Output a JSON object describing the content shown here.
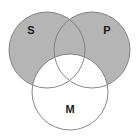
{
  "figure": {
    "name": "three-circle-venn-diagram",
    "background_color": "#ffffff",
    "width": 139,
    "height": 138
  },
  "style": {
    "shaded_fill": "#b5b5b5",
    "unshaded_fill": "#ffffff",
    "stroke_color": "#7a7a7a",
    "stroke_width": 0.9,
    "label_color": "#1a1a1a"
  },
  "circles": [
    {
      "id": "S",
      "label": "S",
      "position": "top-left",
      "shaded": true,
      "fill": "#b5b5b5",
      "cx": 47,
      "cy": 50,
      "r": 38,
      "label_x": 31,
      "label_y": 31
    },
    {
      "id": "P",
      "label": "P",
      "position": "top-right",
      "shaded": true,
      "fill": "#b5b5b5",
      "cx": 92,
      "cy": 50,
      "r": 38,
      "label_x": 107,
      "label_y": 31
    },
    {
      "id": "M",
      "label": "M",
      "position": "bottom-center",
      "shaded": false,
      "fill": "#ffffff",
      "cx": 70,
      "cy": 92,
      "r": 38,
      "label_x": 70,
      "label_y": 110
    }
  ],
  "chart_data": {
    "type": "venn",
    "title": "",
    "sets": [
      "S",
      "P",
      "M"
    ],
    "set_labels": {
      "S": "S",
      "P": "P",
      "M": "M"
    },
    "regions": [
      {
        "region": "S only",
        "shaded": true,
        "fill": "#b5b5b5"
      },
      {
        "region": "P only",
        "shaded": true,
        "fill": "#b5b5b5"
      },
      {
        "region": "S and P only",
        "shaded": true,
        "fill": "#b5b5b5"
      },
      {
        "region": "M only",
        "shaded": false,
        "fill": "#ffffff"
      },
      {
        "region": "S and M only",
        "shaded": false,
        "fill": "#ffffff"
      },
      {
        "region": "P and M only",
        "shaded": false,
        "fill": "#ffffff"
      },
      {
        "region": "S and P and M",
        "shaded": false,
        "fill": "#ffffff"
      }
    ],
    "legend": "none",
    "grid": false
  }
}
